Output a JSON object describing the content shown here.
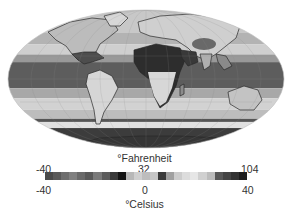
{
  "map": {
    "projection": "mollweide-ellipse",
    "description": "Global surface temperature map (grayscale)",
    "background": "#ffffff",
    "ocean_bands": [
      {
        "lat_from": 90,
        "lat_to": 60,
        "color": "#c9c9c9"
      },
      {
        "lat_from": 60,
        "lat_to": 45,
        "color": "#b3b3b3"
      },
      {
        "lat_from": 45,
        "lat_to": 32,
        "color": "#cfcfcf"
      },
      {
        "lat_from": 32,
        "lat_to": 22,
        "color": "#9a9a9a"
      },
      {
        "lat_from": 22,
        "lat_to": -12,
        "color": "#5e5e5e"
      },
      {
        "lat_from": -12,
        "lat_to": -25,
        "color": "#a8a8a8"
      },
      {
        "lat_from": -25,
        "lat_to": -40,
        "color": "#d2d2d2"
      },
      {
        "lat_from": -40,
        "lat_to": -52,
        "color": "#bdbdbd"
      },
      {
        "lat_from": -52,
        "lat_to": -56,
        "color": "#555555"
      },
      {
        "lat_from": -56,
        "lat_to": -64,
        "color": "#e0e0e0"
      },
      {
        "lat_from": -64,
        "lat_to": -90,
        "color": "#3c3c3c"
      }
    ]
  },
  "legend": {
    "fahrenheit_label": "°Fahrenheit",
    "celsius_label": "°Celsius",
    "fahrenheit_ticks": [
      {
        "value": "-40",
        "x": 36
      },
      {
        "value": "32",
        "x": 138
      },
      {
        "value": "104",
        "x": 241
      }
    ],
    "celsius_ticks": [
      {
        "value": "-40",
        "x": 36
      },
      {
        "value": "0",
        "x": 142
      },
      {
        "value": "40",
        "x": 242
      }
    ],
    "colorbar_range_c": [
      -40,
      40
    ],
    "colorbar_range_f": [
      -40,
      104
    ],
    "colorbar_segments": [
      "#4a4a4a",
      "#5a5a5a",
      "#6e6e6e",
      "#808080",
      "#6a6a6a",
      "#595959",
      "#7a7a7a",
      "#5c5c5c",
      "#3a3a3a",
      "#141414",
      "#b8b8b8",
      "#cfcfcf",
      "#bdbdbd",
      "#c6c6c6",
      "#3a3a3a",
      "#a0a0a0",
      "#cccccc",
      "#dcdcdc",
      "#e6e6e6",
      "#d0d0d0",
      "#bcbcbc",
      "#585858",
      "#444444",
      "#333333",
      "#1e1e1e"
    ]
  }
}
